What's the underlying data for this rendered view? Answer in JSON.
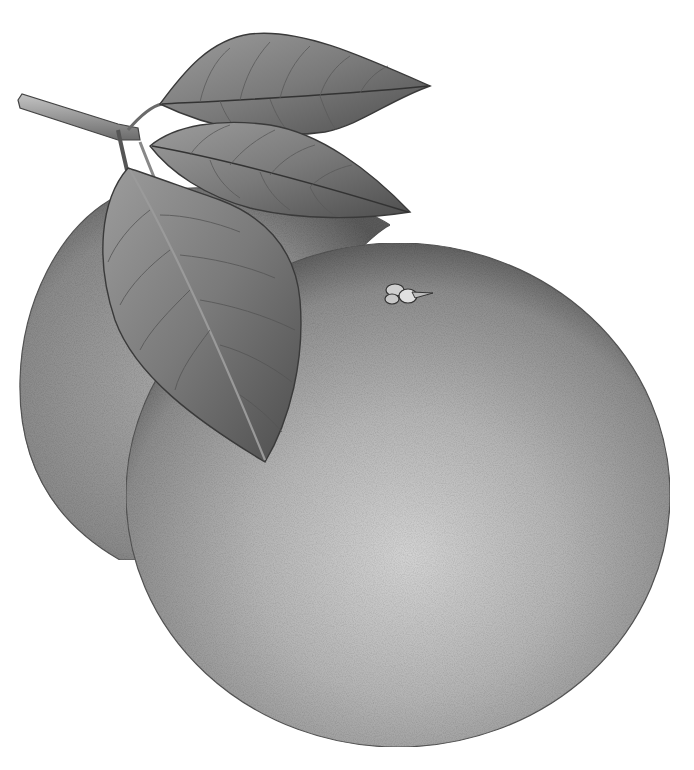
{
  "illustration": {
    "subject": "two citrus fruits with leaves on a stem",
    "style": "grayscale botanical illustration",
    "colors": {
      "background": "#ffffff",
      "fruit_light": "#c9c9c9",
      "fruit_mid": "#9a9a9a",
      "fruit_dark": "#5e5e5e",
      "leaf_light": "#b0b0b0",
      "leaf_dark": "#4a4a4a",
      "outline": "#3a3a3a"
    },
    "fruit_count": 2,
    "leaf_count": 3
  }
}
